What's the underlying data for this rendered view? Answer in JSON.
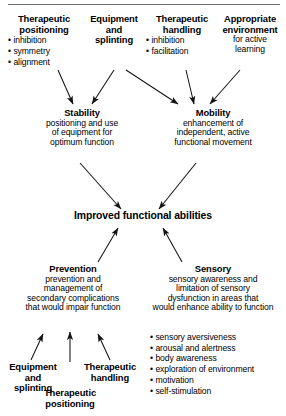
{
  "figure": {
    "title_rule": "",
    "center": {
      "label": "Improved functional abilities"
    },
    "top_inputs": [
      {
        "id": "therapeutic-positioning",
        "heading_lines": [
          "Therapeutic",
          "positioning"
        ],
        "bullets": [
          "inhibition",
          "symmetry",
          "alignment"
        ],
        "sub_lines": []
      },
      {
        "id": "equipment-and-splinting",
        "heading_lines": [
          "Equipment",
          "and",
          "splinting"
        ],
        "bullets": [],
        "sub_lines": []
      },
      {
        "id": "therapeutic-handling",
        "heading_lines": [
          "Therapeutic",
          "handling"
        ],
        "bullets": [
          "inhibition",
          "facilitation"
        ],
        "sub_lines": []
      },
      {
        "id": "appropriate-environment",
        "heading_lines": [
          "Appropriate",
          "environment"
        ],
        "bullets": [],
        "sub_lines": [
          "for active",
          "learning"
        ]
      }
    ],
    "mid_nodes": [
      {
        "id": "stability",
        "heading": "Stability",
        "sub_lines": [
          "positioning and use",
          "of equipment for",
          "optimum function"
        ]
      },
      {
        "id": "mobility",
        "heading": "Mobility",
        "sub_lines": [
          "enhancement of",
          "independent, active",
          "functional movement"
        ]
      }
    ],
    "bottom_nodes": [
      {
        "id": "prevention",
        "heading": "Prevention",
        "sub_lines": [
          "prevention and",
          "management of",
          "secondary complications",
          "that would impair function"
        ],
        "bullets": []
      },
      {
        "id": "sensory",
        "heading": "Sensory",
        "sub_lines": [
          "sensory awareness and",
          "limitation of sensory",
          "dysfunction in areas that",
          "would enhance ability to function"
        ],
        "bullets": [
          "sensory aversiveness",
          "arousal and alertness",
          "body awareness",
          "exploration of environment",
          "motivation",
          "self-stimulation"
        ]
      }
    ],
    "bottom_inputs": [
      {
        "id": "equipment-and-splinting-bottom",
        "lines": [
          "Equipment",
          "and",
          "splinting"
        ]
      },
      {
        "id": "therapeutic-handling-bottom",
        "lines": [
          "Therapeutic",
          "handling"
        ]
      },
      {
        "id": "therapeutic-positioning-bottom",
        "lines": [
          "Therapeutic",
          "positioning"
        ]
      }
    ],
    "colors": {
      "ink": "#000000",
      "rule": "#6f6f6f",
      "arrow": "#1a1a1a",
      "background": "#ffffff"
    }
  }
}
